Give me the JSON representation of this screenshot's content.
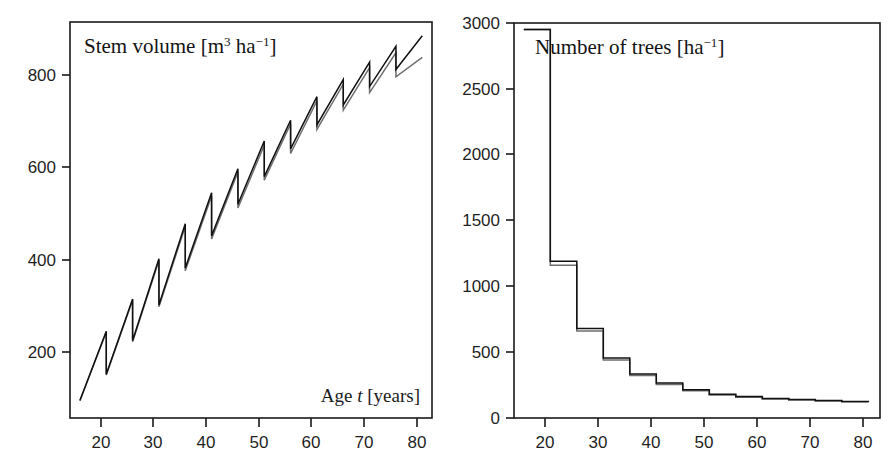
{
  "figure": {
    "background_color": "#ffffff",
    "ink_color": "#1a1a1a",
    "series_a_color": "#111111",
    "series_b_color": "#6e6e6e"
  },
  "chart_data": [
    {
      "id": "stem-volume",
      "type": "line",
      "title": "Stem volume [m3 ha-1]",
      "title_plain": "Stem volume",
      "title_unit_base1": "m",
      "title_unit_sup1": "3",
      "title_unit_base2": "ha",
      "title_unit_sup2": "−1",
      "xlabel": "Age t [years]",
      "xlabel_pre": "Age ",
      "xlabel_var": "t",
      "xlabel_post": " [years]",
      "ylabel": "",
      "xlim": [
        14,
        83
      ],
      "ylim": [
        0,
        900
      ],
      "xticks": [
        20,
        30,
        40,
        50,
        60,
        70,
        80
      ],
      "xticklabels": [
        "20",
        "30",
        "40",
        "50",
        "60",
        "70",
        "80"
      ],
      "yticks": [
        200,
        400,
        600,
        800
      ],
      "yticklabels": [
        "200",
        "400",
        "600",
        "800"
      ],
      "grid": false,
      "legend": "none",
      "notes": "Sawtooth growth curve: stem volume accumulates then drops sharply at each thinning (every 5 years). Two nearly overlapping scenario curves.",
      "series": [
        {
          "name": "scenario-a",
          "color": "#111111",
          "x": [
            16,
            21,
            21,
            26,
            26,
            31,
            31,
            36,
            36,
            41,
            41,
            46,
            46,
            51,
            51,
            56,
            56,
            61,
            61,
            66,
            66,
            71,
            71,
            76,
            76,
            81
          ],
          "values": [
            95,
            245,
            152,
            315,
            225,
            402,
            302,
            478,
            382,
            545,
            452,
            597,
            520,
            657,
            580,
            702,
            640,
            753,
            692,
            790,
            735,
            828,
            775,
            862,
            812,
            885
          ]
        },
        {
          "name": "scenario-b",
          "color": "#6e6e6e",
          "x": [
            16,
            21,
            21,
            26,
            26,
            31,
            31,
            36,
            36,
            41,
            41,
            46,
            46,
            51,
            51,
            56,
            56,
            61,
            61,
            66,
            66,
            71,
            71,
            76,
            76,
            81
          ],
          "values": [
            95,
            243,
            150,
            312,
            222,
            398,
            298,
            472,
            376,
            538,
            445,
            590,
            512,
            648,
            572,
            694,
            630,
            744,
            682,
            780,
            724,
            816,
            762,
            848,
            796,
            838
          ]
        }
      ]
    },
    {
      "id": "number-of-trees",
      "type": "line",
      "title": "Number of trees [ha-1]",
      "title_plain": "Number of trees",
      "title_unit_base1": "ha",
      "title_unit_sup1": "−1",
      "xlabel": "",
      "ylabel": "",
      "xlim": [
        14,
        83
      ],
      "ylim": [
        0,
        3000
      ],
      "xticks": [
        20,
        30,
        40,
        50,
        60,
        70,
        80
      ],
      "xticklabels": [
        "20",
        "30",
        "40",
        "50",
        "60",
        "70",
        "80"
      ],
      "yticks": [
        0,
        500,
        1000,
        1500,
        2000,
        2500,
        3000
      ],
      "yticklabels": [
        "0",
        "500",
        "1000",
        "1500",
        "2000",
        "2500",
        "3000"
      ],
      "grid": false,
      "legend": "none",
      "notes": "Descending step function: stand density reduced at each thinning. Two nearly overlapping scenario curves.",
      "step_x": [
        16,
        21,
        26,
        31,
        36,
        41,
        46,
        51,
        56,
        61,
        66,
        71,
        76,
        81
      ],
      "series": [
        {
          "name": "scenario-a",
          "color": "#111111",
          "step_values": [
            2950,
            1190,
            680,
            455,
            335,
            265,
            215,
            180,
            163,
            148,
            140,
            132,
            126,
            122
          ]
        },
        {
          "name": "scenario-b",
          "color": "#6e6e6e",
          "step_values": [
            2950,
            1160,
            660,
            440,
            322,
            255,
            207,
            174,
            158,
            144,
            136,
            129,
            123,
            119
          ]
        }
      ]
    }
  ]
}
